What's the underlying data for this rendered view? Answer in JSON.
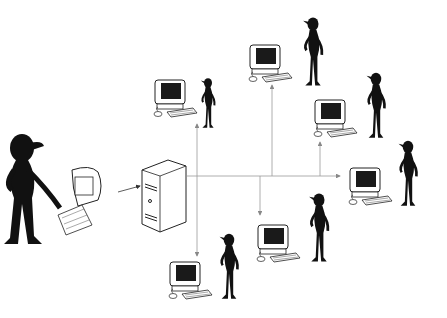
{
  "diagram": {
    "type": "network",
    "colors": {
      "background": "#ffffff",
      "ink": "#111111",
      "line": "#9a9a9a",
      "screen": "#1a1a1a"
    },
    "nodes": [
      {
        "id": "admin",
        "kind": "workstation-with-user",
        "x": 85,
        "y": 200
      },
      {
        "id": "server",
        "kind": "server-tower",
        "x": 165,
        "y": 192
      },
      {
        "id": "client-1",
        "kind": "computer-with-user",
        "x": 175,
        "y": 100
      },
      {
        "id": "client-2",
        "kind": "computer-with-user",
        "x": 265,
        "y": 60
      },
      {
        "id": "client-3",
        "kind": "computer-with-user",
        "x": 335,
        "y": 115
      },
      {
        "id": "client-4",
        "kind": "computer-with-user",
        "x": 365,
        "y": 185
      },
      {
        "id": "client-5",
        "kind": "computer-with-user",
        "x": 275,
        "y": 240
      },
      {
        "id": "client-6",
        "kind": "computer-with-user",
        "x": 185,
        "y": 285
      }
    ],
    "edges": [
      {
        "from": "admin",
        "to": "server"
      },
      {
        "from": "server",
        "to": "client-1"
      },
      {
        "from": "server",
        "to": "client-2"
      },
      {
        "from": "server",
        "to": "client-3"
      },
      {
        "from": "server",
        "to": "client-4"
      },
      {
        "from": "server",
        "to": "client-5"
      },
      {
        "from": "server",
        "to": "client-6"
      }
    ]
  }
}
